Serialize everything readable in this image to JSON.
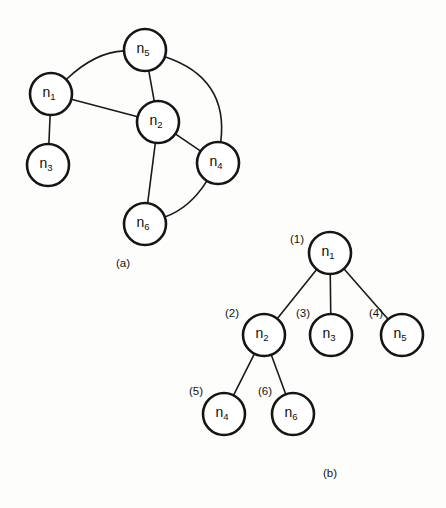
{
  "figure": {
    "width": 446,
    "height": 508,
    "background_color": "#fdfdfc",
    "stroke_color": "#151515",
    "node_fill_color": "#ffffff",
    "panels": [
      {
        "id": "a",
        "caption": "(a)",
        "caption_x": 123,
        "caption_y": 264,
        "title": "undirected graph"
      },
      {
        "id": "b",
        "caption": "(b)",
        "caption_y": 474,
        "caption_x": 330,
        "title": "depth-first spanning tree"
      }
    ]
  },
  "graph_a": {
    "type": "diagram",
    "node_radius": 21,
    "nodes": [
      {
        "id": "n1",
        "base": "n",
        "sub": "1",
        "cx": 51,
        "cy": 94
      },
      {
        "id": "n2",
        "base": "n",
        "sub": "2",
        "cx": 158,
        "cy": 122
      },
      {
        "id": "n3",
        "base": "n",
        "sub": "3",
        "cx": 48,
        "cy": 165
      },
      {
        "id": "n4",
        "base": "n",
        "sub": "4",
        "cx": 218,
        "cy": 163
      },
      {
        "id": "n5",
        "base": "n",
        "sub": "5",
        "cx": 145,
        "cy": 50
      },
      {
        "id": "n6",
        "base": "n",
        "sub": "6",
        "cx": 145,
        "cy": 224
      }
    ],
    "edges": [
      {
        "from": "n1",
        "to": "n5",
        "shape": "curve",
        "curve_x": 95,
        "curve_y": 52
      },
      {
        "from": "n1",
        "to": "n2",
        "shape": "line"
      },
      {
        "from": "n1",
        "to": "n3",
        "shape": "line"
      },
      {
        "from": "n5",
        "to": "n2",
        "shape": "line"
      },
      {
        "from": "n5",
        "to": "n4",
        "shape": "curve",
        "curve_x": 229,
        "curve_y": 78
      },
      {
        "from": "n2",
        "to": "n4",
        "shape": "line"
      },
      {
        "from": "n2",
        "to": "n6",
        "shape": "line"
      },
      {
        "from": "n6",
        "to": "n4",
        "shape": "curve",
        "curve_x": 190,
        "curve_y": 208
      }
    ]
  },
  "tree_b": {
    "type": "diagram",
    "node_radius": 21,
    "nodes": [
      {
        "id": "t1",
        "base": "n",
        "sub": "1",
        "cx": 330,
        "cy": 253,
        "order": "(1)",
        "order_x": 297,
        "order_y": 240
      },
      {
        "id": "t2",
        "base": "n",
        "sub": "2",
        "cx": 264,
        "cy": 335,
        "order": "(2)",
        "order_x": 232,
        "order_y": 314
      },
      {
        "id": "t3",
        "base": "n",
        "sub": "3",
        "cx": 331,
        "cy": 335,
        "order": "(3)",
        "order_x": 303,
        "order_y": 314
      },
      {
        "id": "t5",
        "base": "n",
        "sub": "5",
        "cx": 402,
        "cy": 335,
        "order": "(4)",
        "order_x": 376,
        "order_y": 314
      },
      {
        "id": "t4",
        "base": "n",
        "sub": "4",
        "cx": 224,
        "cy": 414,
        "order": "(5)",
        "order_x": 196,
        "order_y": 392
      },
      {
        "id": "t6",
        "base": "n",
        "sub": "6",
        "cx": 293,
        "cy": 414,
        "order": "(6)",
        "order_x": 265,
        "order_y": 392
      }
    ],
    "edges": [
      {
        "from": "t1",
        "to": "t2"
      },
      {
        "from": "t1",
        "to": "t3"
      },
      {
        "from": "t1",
        "to": "t5"
      },
      {
        "from": "t2",
        "to": "t4"
      },
      {
        "from": "t2",
        "to": "t6"
      }
    ]
  }
}
